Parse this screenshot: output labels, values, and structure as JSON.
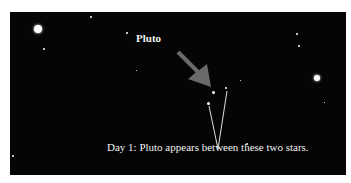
{
  "image": {
    "background_color": "#050505",
    "border_color": "#ffffff",
    "labels": {
      "pluto": "Pluto",
      "caption": "Day 1: Pluto appears between these two stars."
    },
    "arrow_color": "#6a6a6a",
    "pointer_line_color": "#e0e0e0"
  }
}
